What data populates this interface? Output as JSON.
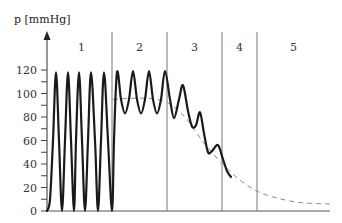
{
  "chart_data": {
    "type": "line",
    "title": "",
    "ylabel": "p [mmHg]",
    "xlabel": "",
    "ylim": [
      0,
      120
    ],
    "yticks": [
      0,
      20,
      40,
      60,
      80,
      100,
      120
    ],
    "yminor_step": 10,
    "grid": false,
    "phases": [
      {
        "label": "1",
        "x_start": 0,
        "x_end": 65
      },
      {
        "label": "2",
        "x_start": 65,
        "x_end": 120
      },
      {
        "label": "3",
        "x_start": 120,
        "x_end": 175
      },
      {
        "label": "4",
        "x_start": 175,
        "x_end": 210
      },
      {
        "label": "5",
        "x_start": 210,
        "x_end": 283
      }
    ],
    "series": [
      {
        "name": "pressure oscillation",
        "style": "solid",
        "color": "#1a1a1a",
        "description": "Full oscillations 0-120 mmHg in phase 1; damped oscillations between ~82 and ~120 mmHg in phase 2; decaying oscillations in phase 3 and early phase 4 converging to the dashed mean curve",
        "points": [
          [
            0,
            0
          ],
          [
            3,
            10
          ],
          [
            6,
            60
          ],
          [
            9,
            118
          ],
          [
            12,
            60
          ],
          [
            15,
            0
          ],
          [
            18,
            60
          ],
          [
            21,
            118
          ],
          [
            24,
            60
          ],
          [
            27,
            0
          ],
          [
            29,
            60
          ],
          [
            32,
            118
          ],
          [
            35,
            60
          ],
          [
            38,
            0
          ],
          [
            41,
            60
          ],
          [
            44,
            118
          ],
          [
            48,
            60
          ],
          [
            51,
            0
          ],
          [
            54,
            60
          ],
          [
            57,
            118
          ],
          [
            61,
            60
          ],
          [
            65,
            0
          ],
          [
            67,
            60
          ],
          [
            70,
            118
          ],
          [
            74,
            95
          ],
          [
            78,
            83
          ],
          [
            82,
            95
          ],
          [
            86,
            119
          ],
          [
            90,
            95
          ],
          [
            94,
            83
          ],
          [
            98,
            95
          ],
          [
            102,
            119
          ],
          [
            106,
            95
          ],
          [
            110,
            83
          ],
          [
            114,
            95
          ],
          [
            118,
            119
          ],
          [
            123,
            95
          ],
          [
            127,
            79
          ],
          [
            132,
            95
          ],
          [
            136,
            107
          ],
          [
            141,
            85
          ],
          [
            145,
            72
          ],
          [
            149,
            73
          ],
          [
            153,
            84
          ],
          [
            157,
            66
          ],
          [
            161,
            50
          ],
          [
            165,
            51
          ],
          [
            171,
            56
          ],
          [
            176,
            44
          ],
          [
            180,
            34
          ],
          [
            184,
            29
          ]
        ]
      },
      {
        "name": "mean pressure",
        "style": "dashed",
        "color": "#888888",
        "points": [
          [
            66,
            95
          ],
          [
            90,
            96
          ],
          [
            110,
            95
          ],
          [
            125,
            90
          ],
          [
            140,
            78
          ],
          [
            155,
            60
          ],
          [
            170,
            45
          ],
          [
            185,
            32
          ],
          [
            200,
            22
          ],
          [
            215,
            15
          ],
          [
            235,
            10
          ],
          [
            255,
            7
          ],
          [
            283,
            6
          ]
        ]
      }
    ]
  }
}
